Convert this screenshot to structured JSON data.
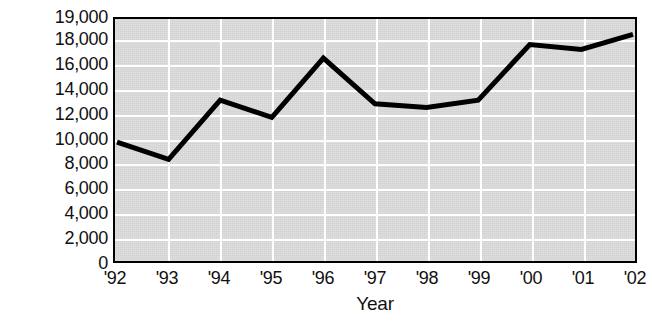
{
  "chart_data": {
    "type": "line",
    "title": "",
    "xlabel": "Year",
    "ylabel": "Number of reported cases",
    "categories": [
      "'92",
      "'93",
      "'94",
      "'95",
      "'96",
      "'97",
      "'98",
      "'99",
      "'00",
      "'01",
      "'02"
    ],
    "values": [
      9800,
      8400,
      13200,
      11800,
      16600,
      12900,
      12600,
      13200,
      17700,
      17300,
      18300
    ],
    "series": [
      {
        "name": "Reported cases",
        "values": [
          9800,
          8400,
          13200,
          11800,
          16600,
          12900,
          12600,
          13200,
          17700,
          17300,
          18300
        ]
      }
    ],
    "ylim": [
      0,
      19000
    ],
    "y_ticks": [
      0,
      2000,
      4000,
      6000,
      8000,
      10000,
      12000,
      14000,
      16000,
      18000,
      19000
    ],
    "y_tick_labels": [
      "0",
      "2,000",
      "4,000",
      "6,000",
      "8,000",
      "10,000",
      "12,000",
      "14,000",
      "16,000",
      "18,000",
      "19,000"
    ],
    "y_axis_note": "Irregular scale: even 2,000 steps from 0 to 18,000, then a compressed step to 19,000 at the top border",
    "grid": true,
    "legend": "none",
    "plot_background_color": "#d2d2d2",
    "gridline_color": "#ffffff",
    "line_color": "#000000",
    "axis_color": "#000000"
  },
  "axes": {
    "y_title": "Number of reported cases",
    "x_title": "Year"
  }
}
